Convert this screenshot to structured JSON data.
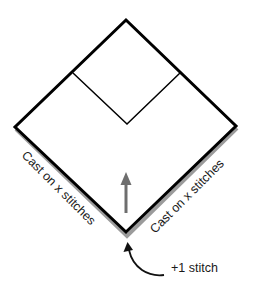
{
  "diagram": {
    "labels": {
      "left_edge": "Cast on x stitches",
      "right_edge": "Cast on x stitches",
      "center_increase": "+1 stitch"
    },
    "icons": {
      "direction_arrow": "arrow-up-icon",
      "pointer_arrow": "curved-arrow-icon"
    },
    "colors": {
      "outline": "#000000",
      "shadow": "#7a7a7a",
      "arrow": "#6e6e6e",
      "text": "#1a1a1a",
      "background": "#ffffff"
    }
  }
}
